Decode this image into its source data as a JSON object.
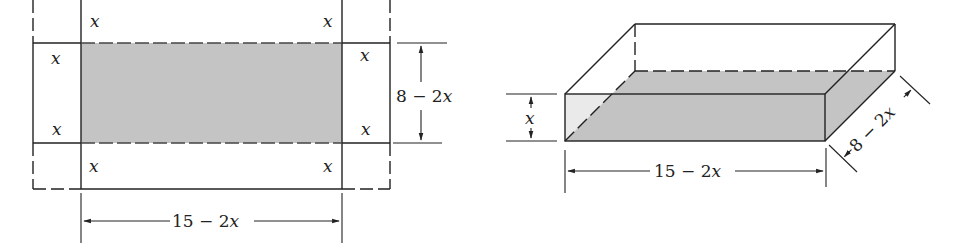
{
  "figure": {
    "left": {
      "title": "flat sheet with corner squares cut",
      "corner_labels": [
        "x",
        "x",
        "x",
        "x",
        "x",
        "x",
        "x",
        "x"
      ],
      "width_label": "15 − 2x",
      "height_label": "8 − 2x"
    },
    "right": {
      "title": "open box",
      "height_label": "x",
      "length_label": "15 − 2x",
      "depth_label": "8 − 2x"
    },
    "colors": {
      "line": "#222222",
      "shade": "#c4c4c4",
      "background": "#ffffff"
    }
  }
}
